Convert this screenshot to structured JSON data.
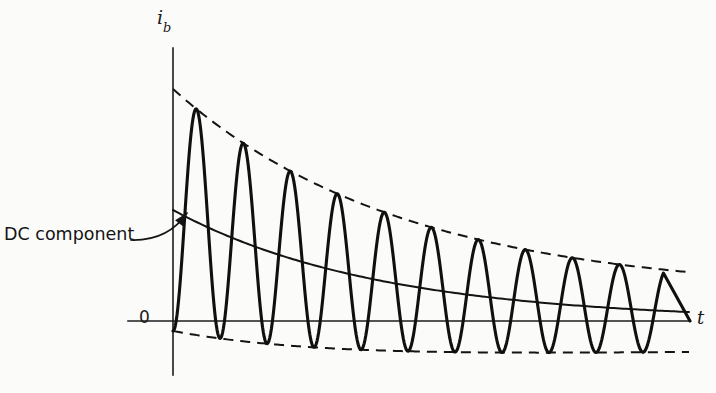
{
  "figure": {
    "background_color": "#fbfbfa",
    "ink_color": "#141414",
    "width": 716,
    "height": 393
  },
  "axes": {
    "y_axis_label": "i",
    "y_axis_subscript": "b",
    "x_axis_label": "t",
    "origin_label": "0",
    "origin_x": 173,
    "origin_y": 321,
    "y_axis_top": 48,
    "y_axis_bottom": 375,
    "x_axis_left": 128,
    "x_axis_right": 690
  },
  "annotation": {
    "label": "DC component",
    "label_x": 4,
    "label_y": 226,
    "leader_start_x": 131,
    "leader_start_y": 240,
    "leader_ctrl_x": 168,
    "leader_ctrl_y": 241,
    "leader_end_x": 187,
    "leader_end_y": 213,
    "arrow_angle_deg": -52,
    "arrow_length": 13,
    "arrow_width": 5
  },
  "chart_data": {
    "type": "line",
    "title": "",
    "xlabel": "t",
    "ylabel": "i_b",
    "grid": false,
    "legend": false,
    "axis_ranges": {
      "x_pixels": [
        173,
        690
      ],
      "y_pixels": [
        48,
        375
      ],
      "baseline_y_pixel": 321
    },
    "series": [
      {
        "name": "total-current",
        "style": "solid-thick",
        "formula": "dc(t) - A0*exp(-t/tau_ac)*cos(2*pi*t/T)",
        "start_x": 173,
        "end_x": 690,
        "wave_end_x": 664,
        "period_px": 47.0,
        "ac_amplitude_px": 121,
        "ac_decay_tau_px": 268,
        "ac_amplitude_floor_px": 26
      },
      {
        "name": "dc-component",
        "style": "solid-thin",
        "formula": "D0*exp(-t/tau_dc)",
        "start_x": 173,
        "end_x": 690,
        "dc_initial_px": 111,
        "dc_decay_tau_px": 205,
        "dc_floor_px": 0
      },
      {
        "name": "upper-envelope",
        "style": "dashed",
        "formula": "dc(t) + amp(t)",
        "start_x": 173,
        "end_x": 690,
        "start_y": 78,
        "end_y": 296
      },
      {
        "name": "lower-envelope",
        "style": "dashed",
        "formula": "dc(t) - amp(t)",
        "start_x": 173,
        "end_x": 690,
        "start_y": 322,
        "end_y": 347
      }
    ],
    "peaks_px": [
      {
        "x": 205,
        "y": 125
      },
      {
        "x": 263,
        "y": 172
      },
      {
        "x": 320,
        "y": 209
      },
      {
        "x": 375,
        "y": 236
      },
      {
        "x": 430,
        "y": 257
      },
      {
        "x": 485,
        "y": 270
      },
      {
        "x": 533,
        "y": 281
      },
      {
        "x": 580,
        "y": 288
      },
      {
        "x": 627,
        "y": 292
      },
      {
        "x": 655,
        "y": 295
      }
    ],
    "dash_pattern": {
      "dash_px": 10,
      "gap_px": 7
    }
  }
}
